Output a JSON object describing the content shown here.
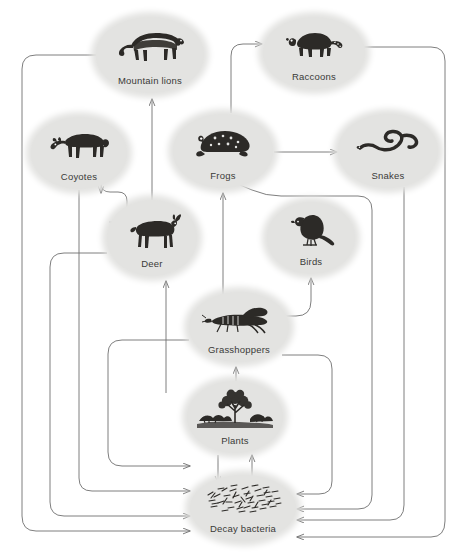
{
  "diagram": {
    "background_color": "#ffffff",
    "node_fill_color": "#e3e3e1",
    "edge_color": "#6f6f6f",
    "label_color": "#3a3a38",
    "width": 464,
    "height": 559
  },
  "nodes": [
    {
      "id": "mountain-lions",
      "label": "Mountain lions",
      "icon": "mountain-lion-icon",
      "cx": 150,
      "cy": 55,
      "rx": 54,
      "ry": 38
    },
    {
      "id": "raccoons",
      "label": "Raccoons",
      "icon": "raccoon-icon",
      "cx": 314,
      "cy": 53,
      "rx": 51,
      "ry": 36
    },
    {
      "id": "coyotes",
      "label": "Coyotes",
      "icon": "coyote-icon",
      "cx": 79,
      "cy": 153,
      "rx": 48,
      "ry": 36
    },
    {
      "id": "frogs",
      "label": "Frogs",
      "icon": "frog-icon",
      "cx": 223,
      "cy": 151,
      "rx": 50,
      "ry": 37
    },
    {
      "id": "snakes",
      "label": "Snakes",
      "icon": "snake-icon",
      "cx": 388,
      "cy": 151,
      "rx": 50,
      "ry": 37
    },
    {
      "id": "deer",
      "label": "Deer",
      "icon": "deer-icon",
      "cx": 152,
      "cy": 238,
      "rx": 45,
      "ry": 38
    },
    {
      "id": "birds",
      "label": "Birds",
      "icon": "bird-icon",
      "cx": 311,
      "cy": 238,
      "rx": 44,
      "ry": 36
    },
    {
      "id": "grasshoppers",
      "label": "Grasshoppers",
      "icon": "grasshopper-icon",
      "cx": 239,
      "cy": 327,
      "rx": 50,
      "ry": 35
    },
    {
      "id": "plants",
      "label": "Plants",
      "icon": "plants-icon",
      "cx": 235,
      "cy": 417,
      "rx": 48,
      "ry": 36
    },
    {
      "id": "decay-bacteria",
      "label": "Decay  bacteria",
      "icon": "bacteria-icon",
      "cx": 243,
      "cy": 508,
      "rx": 53,
      "ry": 33
    }
  ],
  "edges": [
    {
      "id": "deer-to-mountain-lions",
      "from": "deer",
      "to": "mountain-lions"
    },
    {
      "id": "deer-to-coyotes",
      "from": "deer",
      "to": "coyotes"
    },
    {
      "id": "plants-to-deer",
      "from": "plants",
      "to": "deer"
    },
    {
      "id": "plants-to-grasshoppers",
      "from": "plants",
      "to": "grasshoppers"
    },
    {
      "id": "grasshoppers-to-frogs",
      "from": "grasshoppers",
      "to": "frogs"
    },
    {
      "id": "grasshoppers-to-birds",
      "from": "grasshoppers",
      "to": "birds"
    },
    {
      "id": "frogs-to-raccoons",
      "from": "frogs",
      "to": "raccoons"
    },
    {
      "id": "frogs-to-snakes",
      "from": "frogs",
      "to": "snakes"
    },
    {
      "id": "plants-to-decay-bacteria",
      "from": "plants",
      "to": "decay-bacteria"
    },
    {
      "id": "decay-bacteria-to-plants",
      "from": "decay-bacteria",
      "to": "plants"
    },
    {
      "id": "coyotes-to-decay-bacteria",
      "from": "coyotes",
      "to": "decay-bacteria"
    },
    {
      "id": "deer-to-decay-bacteria",
      "from": "deer",
      "to": "decay-bacteria"
    },
    {
      "id": "mountain-lions-to-decay-bacteria",
      "from": "mountain-lions",
      "to": "decay-bacteria"
    },
    {
      "id": "grasshoppers-to-decay-bacteria",
      "from": "grasshoppers",
      "to": "decay-bacteria"
    },
    {
      "id": "birds-to-decay-bacteria",
      "from": "birds",
      "to": "decay-bacteria"
    },
    {
      "id": "frogs-to-decay-bacteria",
      "from": "frogs",
      "to": "decay-bacteria"
    },
    {
      "id": "snakes-to-decay-bacteria",
      "from": "snakes",
      "to": "decay-bacteria"
    },
    {
      "id": "raccoons-to-decay-bacteria",
      "from": "raccoons",
      "to": "decay-bacteria"
    }
  ]
}
